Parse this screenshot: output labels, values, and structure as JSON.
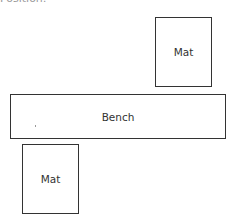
{
  "header": {
    "cropped_text": "Position:"
  },
  "diagram": {
    "elements": [
      {
        "id": "mat-top",
        "label": "Mat",
        "type": "rectangle"
      },
      {
        "id": "bench",
        "label": "Bench",
        "type": "rectangle"
      },
      {
        "id": "mat-bottom",
        "label": "Mat",
        "type": "rectangle"
      }
    ]
  },
  "colors": {
    "outline": "#333333",
    "background": "#ffffff"
  }
}
